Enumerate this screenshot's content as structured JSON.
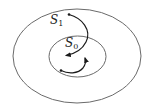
{
  "diagram": {
    "type": "nested-sets",
    "outer_set": {
      "label": "S",
      "subscript": "1",
      "stroke": "#6a6a6a"
    },
    "inner_set": {
      "label": "S",
      "subscript": "0",
      "stroke": "#6a6a6a"
    },
    "arrows": [
      {
        "name": "trajectory-from-S1-into-S0",
        "color": "#1a1a1a"
      },
      {
        "name": "trajectory-within-S0",
        "color": "#1a1a1a"
      }
    ]
  }
}
